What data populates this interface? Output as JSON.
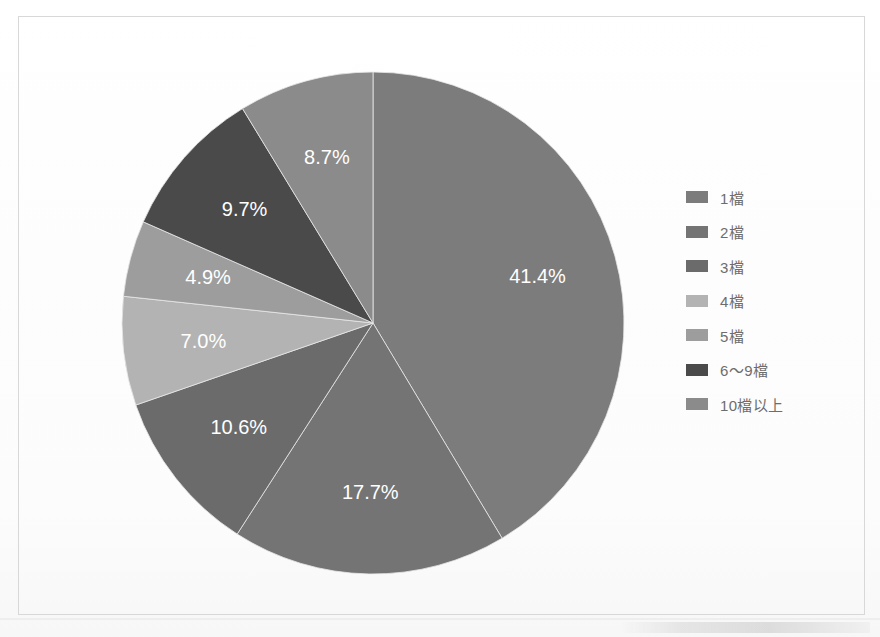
{
  "figure": {
    "background_color": "#fefefe",
    "frame_border_color": "#d8d8d8"
  },
  "chart_data": {
    "type": "pie",
    "title": "",
    "subtitle": "",
    "xlabel": "",
    "ylabel": "",
    "legend_position": "right",
    "grid": false,
    "start_angle_deg": 0,
    "direction": "clockwise",
    "categories": [
      "1檔",
      "2檔",
      "3檔",
      "4檔",
      "5檔",
      "6～9檔",
      "10檔以上"
    ],
    "values": [
      41.4,
      17.7,
      10.6,
      7.0,
      4.9,
      9.7,
      8.7
    ],
    "value_labels": [
      "41.4%",
      "17.7%",
      "10.6%",
      "7.0%",
      "4.9%",
      "9.7%",
      "8.7%"
    ],
    "units": "percent",
    "colors": [
      "#7c7c7c",
      "#747474",
      "#6b6b6b",
      "#b3b3b3",
      "#9d9d9d",
      "#4a4a4a",
      "#8b8b8b"
    ],
    "slices": [
      {
        "label": "1檔",
        "value": 41.4,
        "value_label": "41.4%",
        "color": "#7c7c7c"
      },
      {
        "label": "2檔",
        "value": 17.7,
        "value_label": "17.7%",
        "color": "#747474"
      },
      {
        "label": "3檔",
        "value": 10.6,
        "value_label": "10.6%",
        "color": "#6b6b6b"
      },
      {
        "label": "4檔",
        "value": 7.0,
        "value_label": "7.0%",
        "color": "#b3b3b3"
      },
      {
        "label": "5檔",
        "value": 4.9,
        "value_label": "4.9%",
        "color": "#9d9d9d"
      },
      {
        "label": "6～9檔",
        "value": 9.7,
        "value_label": "9.7%",
        "color": "#4a4a4a"
      },
      {
        "label": "10檔以上",
        "value": 8.7,
        "value_label": "8.7%",
        "color": "#8b8b8b"
      }
    ]
  },
  "legend": {
    "items": [
      {
        "label": "1檔",
        "color": "#7c7c7c"
      },
      {
        "label": "2檔",
        "color": "#747474"
      },
      {
        "label": "3檔",
        "color": "#6b6b6b"
      },
      {
        "label": "4檔",
        "color": "#b3b3b3"
      },
      {
        "label": "5檔",
        "color": "#9d9d9d"
      },
      {
        "label": "6～9檔",
        "color": "#4a4a4a"
      },
      {
        "label": "10檔以上",
        "color": "#8b8b8b"
      }
    ]
  },
  "geometry": {
    "center_x": 373,
    "center_y": 323,
    "radius": 251,
    "label_radius_factor": 0.68
  }
}
